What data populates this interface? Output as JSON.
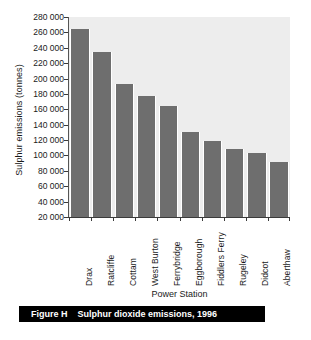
{
  "chart_data": {
    "type": "bar",
    "title": "Sulphur dioxide emissions, 1996",
    "xlabel": "Power Station",
    "ylabel": "Sulphur emissions (tonnes)",
    "categories": [
      "Drax",
      "Ratcliffe",
      "Cottam",
      "West Burton",
      "Ferrybridge",
      "Eggborough",
      "Fiddlers Ferry",
      "Rugeley",
      "Didcot",
      "Aberthaw"
    ],
    "values": [
      265000,
      235000,
      193000,
      177000,
      164000,
      130000,
      119000,
      109000,
      103000,
      91000
    ],
    "ylim": [
      20000,
      280000
    ],
    "ytick_step": 20000,
    "ytick_labels": [
      "280 000",
      "260 000",
      "240 000",
      "220 000",
      "200 000",
      "180 000",
      "160 000",
      "140 000",
      "120 000",
      "100 000",
      "80 000",
      "60 000",
      "40 000",
      "20 000"
    ],
    "grid": false,
    "legend": false,
    "bar_color": "#6e6e6e",
    "plot_background": "#ededed"
  },
  "caption": {
    "label": "Figure H",
    "text": "Sulphur dioxide emissions, 1996"
  }
}
